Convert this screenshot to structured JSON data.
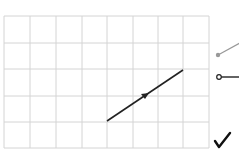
{
  "grid": {
    "columns": 8,
    "rows": 5,
    "x_lines": [
      4,
      30,
      56,
      82,
      107,
      133,
      158,
      183,
      209
    ],
    "y_lines": [
      16,
      43,
      69,
      96,
      122,
      148
    ],
    "line_color": "#d4d4d4"
  },
  "segment": {
    "from": [
      107,
      121
    ],
    "to": [
      183,
      70
    ],
    "color": "#222222",
    "arrow_at": [
      145,
      96
    ]
  },
  "tools": [
    {
      "name": "line-tool",
      "color": "#999999"
    },
    {
      "name": "ray-tool",
      "color": "#222222"
    },
    {
      "name": "confirm-check",
      "glyph": "✓"
    }
  ]
}
